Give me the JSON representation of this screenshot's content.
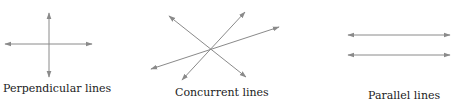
{
  "diagram": {
    "line_color": "#8a8a8a",
    "panels": [
      {
        "id": "perpendicular",
        "label": "Perpendicular lines",
        "lines": [
          {
            "x1": 49,
            "y1": 13,
            "x2": 49,
            "y2": 77
          },
          {
            "x1": 5,
            "y1": 44,
            "x2": 92,
            "y2": 44
          }
        ]
      },
      {
        "id": "concurrent",
        "label": "Concurrent lines",
        "lines": [
          {
            "x1": 169,
            "y1": 16,
            "x2": 246,
            "y2": 77
          },
          {
            "x1": 245,
            "y1": 12,
            "x2": 182,
            "y2": 80
          },
          {
            "x1": 279,
            "y1": 27,
            "x2": 151,
            "y2": 69
          }
        ]
      },
      {
        "id": "parallel",
        "label": "Parallel lines",
        "lines": [
          {
            "x1": 348,
            "y1": 35,
            "x2": 450,
            "y2": 35
          },
          {
            "x1": 348,
            "y1": 55,
            "x2": 450,
            "y2": 55
          }
        ]
      }
    ]
  }
}
